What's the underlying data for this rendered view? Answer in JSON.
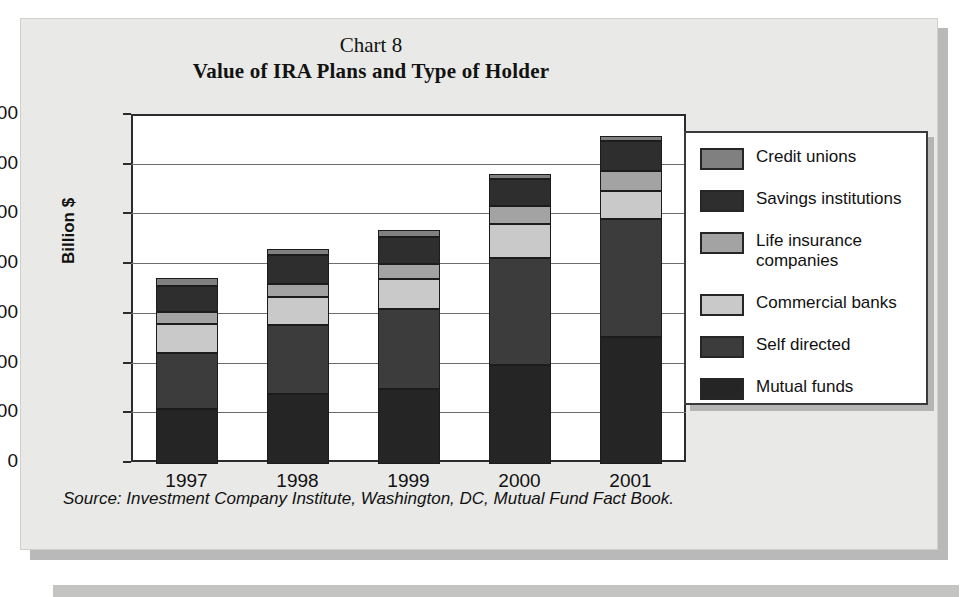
{
  "figure": {
    "chart_number": "Chart 8",
    "title": "Value of IRA Plans and Type of Holder",
    "source": "Source: Investment Company Institute, Washington, DC, Mutual Fund Fact Book."
  },
  "axes": {
    "ylabel": "Billion $",
    "yticks": [
      "0",
      "200",
      "400",
      "600",
      "800",
      "1000",
      "1200",
      "1400"
    ],
    "xticks": [
      "1997",
      "1998",
      "1999",
      "2000",
      "2001"
    ]
  },
  "legend": {
    "position": "right",
    "entries": [
      {
        "label": "Credit unions",
        "color": "#808080"
      },
      {
        "label": "Savings institutions",
        "color": "#2e2e2e"
      },
      {
        "label": "Life insurance\ncompanies",
        "color": "#a3a3a3"
      },
      {
        "label": "Commercial banks",
        "color": "#c9c9c9"
      },
      {
        "label": "Self directed",
        "color": "#3c3c3c"
      },
      {
        "label": "Mutual funds",
        "color": "#252525"
      }
    ]
  },
  "chart_data": {
    "type": "bar",
    "stacked": true,
    "title": "Value of IRA Plans and Type of Holder",
    "xlabel": "",
    "ylabel": "Billion $",
    "ylim": [
      0,
      1400
    ],
    "ytick_step": 200,
    "grid": true,
    "legend_position": "right",
    "categories": [
      "1997",
      "1998",
      "1999",
      "2000",
      "2001"
    ],
    "series": [
      {
        "name": "Mutual funds",
        "color": "#252525",
        "values": [
          220,
          280,
          300,
          400,
          510
        ]
      },
      {
        "name": "Self directed",
        "color": "#3c3c3c",
        "values": [
          225,
          280,
          325,
          430,
          475
        ]
      },
      {
        "name": "Commercial banks",
        "color": "#c9c9c9",
        "values": [
          120,
          110,
          120,
          135,
          115
        ]
      },
      {
        "name": "Life insurance companies",
        "color": "#a3a3a3",
        "values": [
          45,
          55,
          60,
          75,
          80
        ]
      },
      {
        "name": "Savings institutions",
        "color": "#2e2e2e",
        "values": [
          105,
          115,
          110,
          105,
          120
        ]
      },
      {
        "name": "Credit unions",
        "color": "#808080",
        "values": [
          35,
          25,
          25,
          20,
          20
        ]
      }
    ],
    "totals": [
      750,
      865,
      940,
      1165,
      1320
    ]
  }
}
